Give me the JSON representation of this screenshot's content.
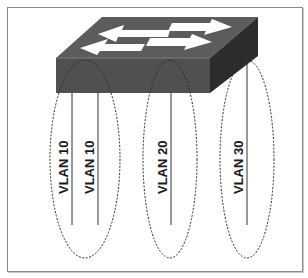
{
  "diagram": {
    "title": "",
    "switch": {
      "icon": "network-switch-icon",
      "colors": {
        "top": "#5a5a5a",
        "front": "#4f4f4f",
        "side": "#2f2f2f",
        "arrow": "#ffffff"
      }
    },
    "groups": [
      {
        "name": "group-1",
        "ports": [
          {
            "label": "VLAN 10"
          },
          {
            "label": "VLAN 10"
          }
        ]
      },
      {
        "name": "group-2",
        "ports": [
          {
            "label": "VLAN 20"
          }
        ]
      },
      {
        "name": "group-3",
        "ports": [
          {
            "label": "VLAN 30"
          }
        ]
      }
    ]
  }
}
